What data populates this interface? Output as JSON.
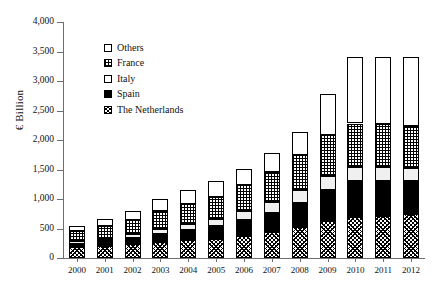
{
  "chart_data": {
    "type": "bar",
    "stacked": true,
    "title": "",
    "xlabel": "",
    "ylabel": "€ Billion",
    "ylim": [
      0,
      4000
    ],
    "ytick_step": 500,
    "ytick_labels": [
      "0",
      "500",
      "1,000",
      "1,500",
      "2,000",
      "2,500",
      "3,000",
      "3,500",
      "4,000"
    ],
    "ytick_values": [
      0,
      500,
      1000,
      1500,
      2000,
      2500,
      3000,
      3500,
      4000
    ],
    "grid": false,
    "legend_position": "upper-left-inside",
    "categories": [
      "2000",
      "2001",
      "2002",
      "2003",
      "2004",
      "2005",
      "2006",
      "2007",
      "2008",
      "2009",
      "2010",
      "2011",
      "2012"
    ],
    "stack_order_bottom_to_top": [
      "The Netherlands",
      "Spain",
      "Italy",
      "France",
      "Others"
    ],
    "series": [
      {
        "name": "The Netherlands",
        "fill": "diagonal-crosshatch",
        "values": [
          180,
          200,
          230,
          270,
          300,
          330,
          380,
          440,
          520,
          620,
          700,
          720,
          740
        ]
      },
      {
        "name": "Spain",
        "fill": "solid-black",
        "values": [
          60,
          80,
          110,
          140,
          180,
          210,
          260,
          330,
          420,
          540,
          600,
          590,
          560
        ]
      },
      {
        "name": "Italy",
        "fill": "white",
        "values": [
          40,
          50,
          60,
          80,
          100,
          120,
          150,
          180,
          210,
          230,
          250,
          240,
          230
        ]
      },
      {
        "name": "France",
        "fill": "grid-crosshatch",
        "values": [
          170,
          210,
          250,
          300,
          340,
          380,
          440,
          510,
          590,
          690,
          730,
          720,
          710
        ]
      },
      {
        "name": "Others",
        "fill": "white",
        "values": [
          100,
          120,
          150,
          210,
          240,
          260,
          280,
          320,
          400,
          700,
          1120,
          1130,
          1160
        ]
      }
    ],
    "totals": [
      550,
      660,
      800,
      1000,
      1160,
      1300,
      1510,
      1780,
      2140,
      2780,
      3400,
      3400,
      3400
    ],
    "legend": [
      {
        "label": "Others",
        "fill": "white"
      },
      {
        "label": "France",
        "fill": "grid-crosshatch"
      },
      {
        "label": "Italy",
        "fill": "white"
      },
      {
        "label": "Spain",
        "fill": "solid-black"
      },
      {
        "label": "The Netherlands",
        "fill": "diagonal-crosshatch"
      }
    ]
  }
}
